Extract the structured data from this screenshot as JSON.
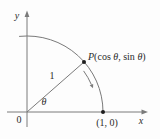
{
  "figure": {
    "colors": {
      "background": "#fdfdfd",
      "line": "#7a7a7a",
      "dot": "#1d1d1d",
      "text": "#2b2b2b"
    },
    "labels": {
      "y_axis": "y",
      "x_axis": "x",
      "origin": "0",
      "angle": "θ",
      "radius": "1",
      "x_intercept_point": "(1, 0)",
      "point_p": {
        "p": "P",
        "part1": "(cos ",
        "theta1": "θ",
        "part2": ", sin ",
        "theta2": "θ",
        "part3": ")"
      }
    }
  }
}
